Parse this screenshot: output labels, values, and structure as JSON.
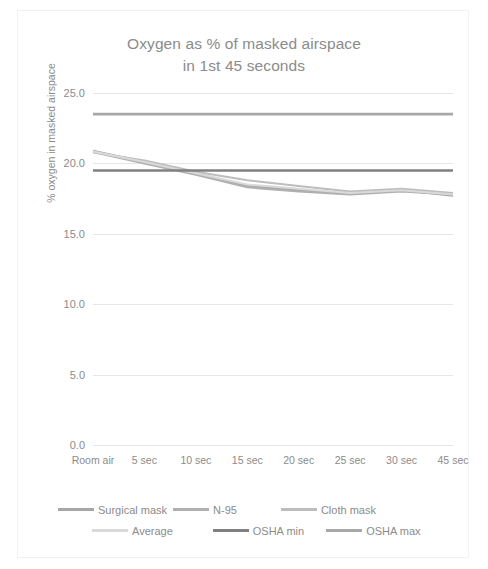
{
  "chart_data": {
    "type": "line",
    "title": "Oxygen as % of masked airspace in 1st 45 seconds",
    "title_line1": "Oxygen as % of masked airspace",
    "title_line2": "in 1st 45 seconds",
    "xlabel": "",
    "ylabel": "% oxygen in masked airspace",
    "categories": [
      "Room air",
      "5 sec",
      "10 sec",
      "15 sec",
      "20 sec",
      "25 sec",
      "30 sec",
      "45 sec"
    ],
    "ylim": [
      0.0,
      25.0
    ],
    "ytick_labels": [
      "0.0",
      "5.0",
      "10.0",
      "15.0",
      "20.0",
      "25.0"
    ],
    "ytick_values": [
      0.0,
      5.0,
      10.0,
      15.0,
      20.0,
      25.0
    ],
    "grid": true,
    "legend_position": "bottom",
    "series": [
      {
        "name": "Surgical mask",
        "color": "#a6a6a6",
        "width": 2.0,
        "values": [
          20.9,
          20.1,
          19.3,
          18.4,
          18.1,
          17.9,
          18.1,
          17.7
        ]
      },
      {
        "name": "N-95",
        "color": "#b0b0b0",
        "width": 2.0,
        "values": [
          20.8,
          20.0,
          19.2,
          18.3,
          18.0,
          17.8,
          18.0,
          17.8
        ]
      },
      {
        "name": "Cloth mask",
        "color": "#bdbdbd",
        "width": 2.0,
        "values": [
          20.8,
          20.2,
          19.4,
          18.8,
          18.4,
          18.0,
          18.2,
          17.9
        ]
      },
      {
        "name": "Average",
        "color": "#d9d9d9",
        "width": 2.0,
        "values": [
          20.85,
          20.1,
          19.3,
          18.5,
          18.2,
          17.9,
          18.1,
          17.8
        ]
      },
      {
        "name": "OSHA min",
        "color": "#808080",
        "width": 2.6,
        "values": [
          19.5,
          19.5,
          19.5,
          19.5,
          19.5,
          19.5,
          19.5,
          19.5
        ]
      },
      {
        "name": "OSHA max",
        "color": "#a8a8a8",
        "width": 2.6,
        "values": [
          23.5,
          23.5,
          23.5,
          23.5,
          23.5,
          23.5,
          23.5,
          23.5
        ]
      }
    ],
    "legend": [
      {
        "label": "Surgical mask",
        "color": "#a6a6a6"
      },
      {
        "label": "N-95",
        "color": "#b0b0b0"
      },
      {
        "label": "Cloth mask",
        "color": "#bdbdbd"
      },
      {
        "label": "Average",
        "color": "#d9d9d9"
      },
      {
        "label": "OSHA min",
        "color": "#808080"
      },
      {
        "label": "OSHA max",
        "color": "#a8a8a8"
      }
    ],
    "colors": {
      "text": "#8b8b8b",
      "grid": "#e6e6e6",
      "background": "#ffffff",
      "border": "#f2f2f2"
    }
  }
}
